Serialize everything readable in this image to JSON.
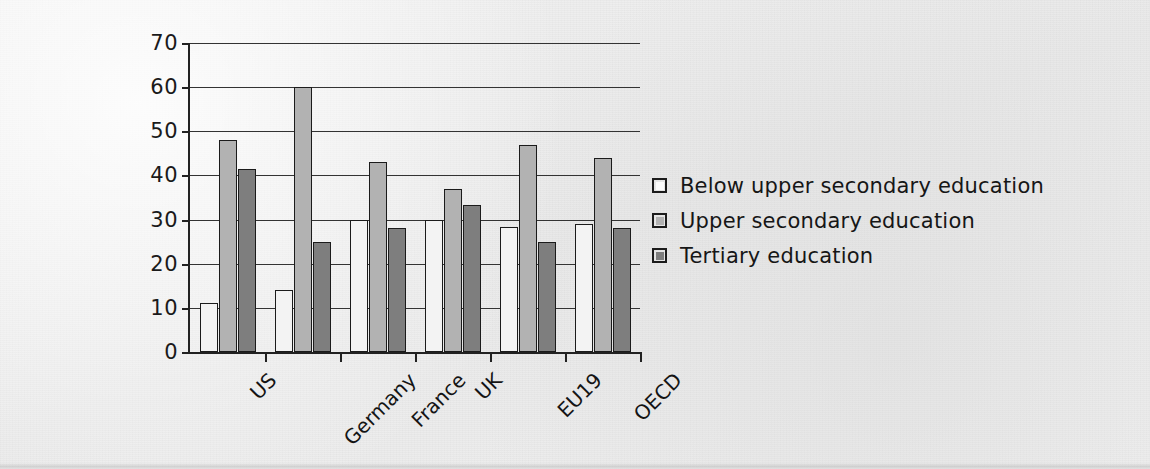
{
  "chart_data": {
    "type": "bar",
    "title": "",
    "xlabel": "",
    "ylabel": "",
    "ylim": [
      0,
      70
    ],
    "yticks": [
      0,
      10,
      20,
      30,
      40,
      50,
      60,
      70
    ],
    "grid": true,
    "legend_position": "right",
    "categories": [
      "US",
      "Germany",
      "France",
      "UK",
      "EU19",
      "OECD"
    ],
    "series": [
      {
        "name": "Below upper secondary education",
        "color": "#f3f3f3",
        "values": [
          11,
          14,
          30,
          30,
          28.3,
          29
        ]
      },
      {
        "name": "Upper secondary education",
        "color": "#b2b2b2",
        "values": [
          48,
          60,
          43,
          37,
          47,
          44
        ]
      },
      {
        "name": "Tertiary education",
        "color": "#7e7e7e",
        "values": [
          41.5,
          25,
          28,
          33.3,
          25,
          28
        ]
      }
    ]
  },
  "axis": {
    "ytick_labels": [
      "0",
      "10",
      "20",
      "30",
      "40",
      "50",
      "60",
      "70"
    ]
  },
  "legend": {
    "items": [
      {
        "label": "Below upper secondary education",
        "swatch": "legend-swatch-below-upper-secondary"
      },
      {
        "label": "Upper secondary education",
        "swatch": "legend-swatch-upper-secondary"
      },
      {
        "label": "Tertiary education",
        "swatch": "legend-swatch-tertiary"
      }
    ]
  }
}
